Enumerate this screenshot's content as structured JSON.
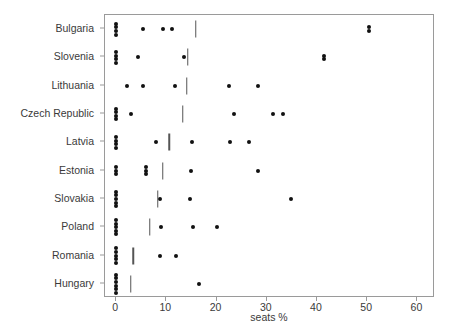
{
  "chart_data": {
    "type": "scatter",
    "title": "",
    "subtitle": "",
    "xlabel": "seats %",
    "ylabel": "",
    "xlim": [
      -2.2,
      63.5
    ],
    "xticks": [
      0,
      10,
      20,
      30,
      40,
      50,
      60
    ],
    "xtick_labels": [
      "0",
      "10",
      "20",
      "30",
      "40",
      "50",
      "60"
    ],
    "grid": false,
    "legend": null,
    "categories": [
      "Bulgaria",
      "Slovenia",
      "Lithuania",
      "Czech Republic",
      "Latvia",
      "Estonia",
      "Slovakia",
      "Poland",
      "Romania",
      "Hungary"
    ],
    "marker_color": "#111111",
    "bar_color": "#555555",
    "frame_color": "#9a9a9a",
    "series": [
      {
        "name": "Bulgaria",
        "points": [
          0,
          0,
          0,
          0,
          5.4,
          9.3,
          11.2,
          50.3,
          50.3
        ],
        "reference": 15.9
      },
      {
        "name": "Slovenia",
        "points": [
          0,
          0,
          0,
          0,
          4.4,
          13.5,
          41.4,
          41.4
        ],
        "reference": 14.3
      },
      {
        "name": "Lithuania",
        "points": [
          2.1,
          5.4,
          11.7,
          22.4,
          28.2
        ],
        "reference": 14.1
      },
      {
        "name": "Czech Republic",
        "points": [
          0,
          0,
          0,
          0,
          2.9,
          23.5,
          31.3,
          33.3
        ],
        "reference": 13.3
      },
      {
        "name": "Latvia",
        "points": [
          0,
          0,
          0,
          0,
          8.0,
          15.2,
          22.6,
          26.5
        ],
        "reference": 10.6
      },
      {
        "name": "Estonia",
        "points": [
          0,
          0,
          0,
          6.0,
          6.0,
          6.0,
          15.0,
          28.2
        ],
        "reference": 9.3
      },
      {
        "name": "Slovakia",
        "points": [
          0,
          0,
          0,
          0,
          0,
          8.8,
          14.8,
          34.8
        ],
        "reference": 8.3
      },
      {
        "name": "Poland",
        "points": [
          0,
          0,
          0,
          0,
          0,
          8.9,
          15.4,
          20.1
        ],
        "reference": 6.7
      },
      {
        "name": "Romania",
        "points": [
          0,
          0,
          0,
          0,
          0,
          8.8,
          11.9
        ],
        "reference": 3.4
      },
      {
        "name": "Hungary",
        "points": [
          0,
          0,
          0,
          0,
          0,
          0,
          16.6
        ],
        "reference": 2.9
      }
    ]
  }
}
